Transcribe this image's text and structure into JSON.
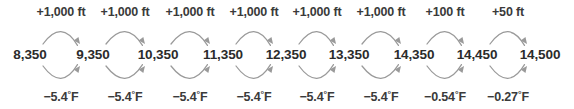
{
  "diagram": {
    "type": "sequential-arrow-chain",
    "background_color": "#ffffff",
    "value_text_color": "#2b2b2b",
    "label_text_color": "#3a3a3a",
    "arc_color": "#9a9a9a",
    "values": [
      {
        "label": "8,350",
        "x": 30
      },
      {
        "label": "9,350",
        "x": 93
      },
      {
        "label": "10,350",
        "x": 158
      },
      {
        "label": "11,350",
        "x": 223
      },
      {
        "label": "12,350",
        "x": 286
      },
      {
        "label": "13,350",
        "x": 349
      },
      {
        "label": "14,350",
        "x": 414
      },
      {
        "label": "14,450",
        "x": 477
      },
      {
        "label": "14,500",
        "x": 540
      }
    ],
    "top_labels": [
      {
        "text": "+1,000 ft",
        "x": 61
      },
      {
        "text": "+1,000 ft",
        "x": 125
      },
      {
        "text": "+1,000 ft",
        "x": 190
      },
      {
        "text": "+1,000 ft",
        "x": 254
      },
      {
        "text": "+1,000 ft",
        "x": 317
      },
      {
        "text": "+1,000 ft",
        "x": 381
      },
      {
        "text": "+100 ft",
        "x": 445
      },
      {
        "text": "+50 ft",
        "x": 508
      }
    ],
    "bottom_labels": [
      {
        "sign": "−5.4",
        "unit": "F",
        "x": 61
      },
      {
        "sign": "−5.4",
        "unit": "F",
        "x": 125
      },
      {
        "sign": "−5.4",
        "unit": "F",
        "x": 190
      },
      {
        "sign": "−5.4",
        "unit": "F",
        "x": 254
      },
      {
        "sign": "−5.4",
        "unit": "F",
        "x": 317
      },
      {
        "sign": "−5.4",
        "unit": "F",
        "x": 381
      },
      {
        "sign": "−0.54",
        "unit": "F",
        "x": 445
      },
      {
        "sign": "−0.27",
        "unit": "F",
        "x": 508
      }
    ],
    "arcs": {
      "top": [
        {
          "x1": 30,
          "x2": 93
        },
        {
          "x1": 93,
          "x2": 158
        },
        {
          "x1": 158,
          "x2": 223
        },
        {
          "x1": 223,
          "x2": 286
        },
        {
          "x1": 286,
          "x2": 349
        },
        {
          "x1": 349,
          "x2": 414
        },
        {
          "x1": 414,
          "x2": 477
        },
        {
          "x1": 477,
          "x2": 540
        }
      ],
      "bottom": [
        {
          "x1": 30,
          "x2": 93
        },
        {
          "x1": 93,
          "x2": 158
        },
        {
          "x1": 158,
          "x2": 223
        },
        {
          "x1": 223,
          "x2": 286
        },
        {
          "x1": 286,
          "x2": 349
        },
        {
          "x1": 349,
          "x2": 414
        },
        {
          "x1": 414,
          "x2": 477
        },
        {
          "x1": 477,
          "x2": 540
        }
      ]
    }
  },
  "chart_data": {
    "type": "diagram",
    "nodes": [
      "8,350",
      "9,350",
      "10,350",
      "11,350",
      "12,350",
      "13,350",
      "14,350",
      "14,450",
      "14,500"
    ],
    "node_values": [
      8350,
      9350,
      10350,
      11350,
      12350,
      13350,
      14350,
      14450,
      14500
    ],
    "node_unit": "ft",
    "forward_edges": {
      "direction": "left-to-right (top arcs)",
      "labels": [
        "+1,000 ft",
        "+1,000 ft",
        "+1,000 ft",
        "+1,000 ft",
        "+1,000 ft",
        "+1,000 ft",
        "+100 ft",
        "+50 ft"
      ],
      "values": [
        1000,
        1000,
        1000,
        1000,
        1000,
        1000,
        100,
        50
      ],
      "unit": "ft"
    },
    "return_edges": {
      "direction": "left-to-right (bottom arcs)",
      "labels": [
        "−5.4°F",
        "−5.4°F",
        "−5.4°F",
        "−5.4°F",
        "−5.4°F",
        "−5.4°F",
        "−0.54°F",
        "−0.27°F"
      ],
      "values": [
        -5.4,
        -5.4,
        -5.4,
        -5.4,
        -5.4,
        -5.4,
        -0.54,
        -0.27
      ],
      "unit": "°F"
    }
  }
}
